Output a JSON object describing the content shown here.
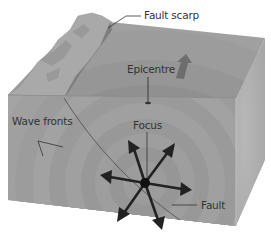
{
  "diagram": {
    "type": "earthquake-block-diagram",
    "labels": {
      "fault_scarp": "Fault scarp",
      "epicentre": "Epicentre",
      "wave_fronts": "Wave fronts",
      "focus": "Focus",
      "fault": "Fault"
    },
    "colors": {
      "background": "#ffffff",
      "block_front": "#9a9a9a",
      "block_top": "#8f8f8f",
      "block_side": "#b4b4b4",
      "ring_dark": "#8a8a8a",
      "ring_light": "#a3a3a3",
      "scarp": "#a8a8a8",
      "arrows": "#222222",
      "label_text": "#333333",
      "leader_lines": "#333333"
    },
    "arrow_count": 6
  }
}
